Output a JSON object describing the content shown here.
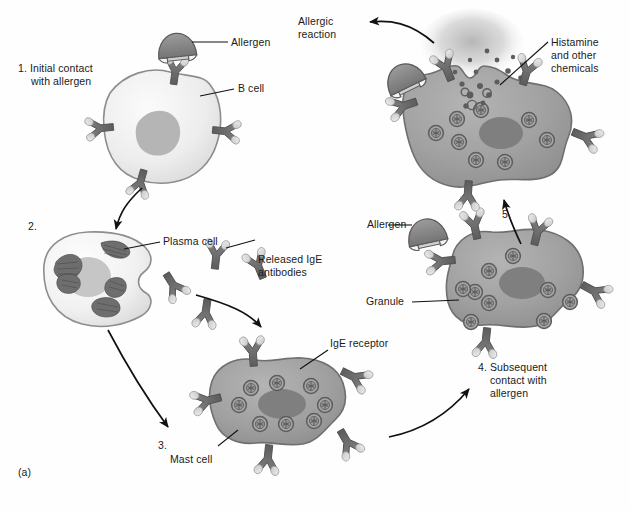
{
  "figure": {
    "panel_label": "(a)",
    "background_color": "#fefefe",
    "ink_color": "#1a1a1a"
  },
  "palette": {
    "b_cell_fill": "#ececec",
    "b_cell_stroke": "#8d8d8d",
    "b_cell_nucleus": "#b3b3b3",
    "plasma_cell_fill": "#f2f2f2",
    "plasma_cell_stroke": "#8d8d8d",
    "plasma_nucleus": "#c3c3c3",
    "er_dark": "#6e6e6e",
    "mast_cell_fill": "#9c9c9c",
    "mast_cell_stroke": "#6f6f6f",
    "mast_nucleus": "#7d7d7d",
    "granule_fill": "#8f8f8f",
    "granule_stroke": "#5f5f5f",
    "antibody_fill": "#6b6b6b",
    "antibody_tip": "#dcdcdc",
    "allergen_fill": "#8a8a8a",
    "allergen_stroke": "#5f5f5f",
    "histamine_cloud": "#b5b5b5",
    "arrow_color": "#111111"
  },
  "steps": [
    {
      "id": "step1",
      "number": "1.",
      "text": "1. Initial contact\n    with allergen"
    },
    {
      "id": "step2",
      "number": "2.",
      "text": "2."
    },
    {
      "id": "step3",
      "number": "3.",
      "text": "3."
    },
    {
      "id": "step4",
      "number": "4.",
      "text": "4. Subsequent\n    contact with\n    allergen"
    },
    {
      "id": "step5",
      "number": "5.",
      "text": "5."
    }
  ],
  "labels": {
    "allergen_top": "Allergen",
    "b_cell": "B cell",
    "plasma_cell": "Plasma cell",
    "released_ige_antibodies": "Released IgE\nantibodies",
    "ige_receptor": "IgE receptor",
    "mast_cell": "Mast cell",
    "allergen_right": "Allergen",
    "granule": "Granule",
    "histamine_and_other_chemicals": "Histamine\nand other\nchemicals",
    "allergic_reaction": "Allergic\nreaction",
    "step1": "1. Initial contact",
    "step1_line2": "with allergen",
    "step2": "2.",
    "step3": "3.",
    "step4": "4. Subsequent",
    "step4_line2": "contact with",
    "step4_line3": "allergen",
    "step5": "5.",
    "panel": "(a)"
  },
  "cells": [
    {
      "name": "b-cell",
      "stage": 1,
      "receptors": 4,
      "granules": 0,
      "nucleus": true
    },
    {
      "name": "plasma-cell",
      "stage": 2,
      "receptors": 0,
      "granules": 0,
      "nucleus": true
    },
    {
      "name": "mast-cell-3",
      "stage": 3,
      "receptors": 5,
      "granules": 8,
      "nucleus": true
    },
    {
      "name": "mast-cell-4",
      "stage": 4,
      "receptors": 5,
      "granules": 9,
      "nucleus": true
    },
    {
      "name": "mast-cell-5",
      "stage": 5,
      "receptors": 5,
      "granules": 9,
      "nucleus": true
    }
  ],
  "free_antibodies_count": 4,
  "allergen_count": 3
}
